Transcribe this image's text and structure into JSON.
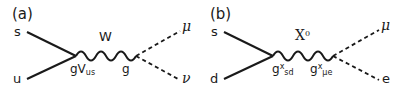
{
  "figure": {
    "background_color": "#ffffff",
    "line_color": "#1a1a1a",
    "panels": [
      {
        "tag": "(a)",
        "incoming": [
          {
            "label": "s",
            "position": "top-left",
            "style": "solid"
          },
          {
            "label": "u",
            "position": "bottom-left",
            "style": "solid"
          }
        ],
        "propagator": {
          "label": "W",
          "superscript": "",
          "style": "wavy"
        },
        "vertices": [
          {
            "label": "gV",
            "subscript": "us",
            "superscript": "",
            "position": "left"
          },
          {
            "label": "g",
            "subscript": "",
            "superscript": "",
            "position": "right"
          }
        ],
        "outgoing": [
          {
            "label": "μ",
            "position": "top-right",
            "style": "dashed"
          },
          {
            "label": "ν",
            "position": "bottom-right",
            "style": "dashed"
          }
        ]
      },
      {
        "tag": "(b)",
        "incoming": [
          {
            "label": "s",
            "position": "top-left",
            "style": "solid"
          },
          {
            "label": "d",
            "position": "bottom-left",
            "style": "solid"
          }
        ],
        "propagator": {
          "label": "X",
          "superscript": "0",
          "style": "wavy"
        },
        "vertices": [
          {
            "label": "g",
            "subscript": "sd",
            "superscript": "x",
            "position": "left"
          },
          {
            "label": "g",
            "subscript": "μe",
            "superscript": "x",
            "position": "right"
          }
        ],
        "outgoing": [
          {
            "label": "μ",
            "position": "top-right",
            "style": "dashed"
          },
          {
            "label": "e",
            "position": "bottom-right",
            "style": "dashed"
          }
        ]
      }
    ]
  }
}
